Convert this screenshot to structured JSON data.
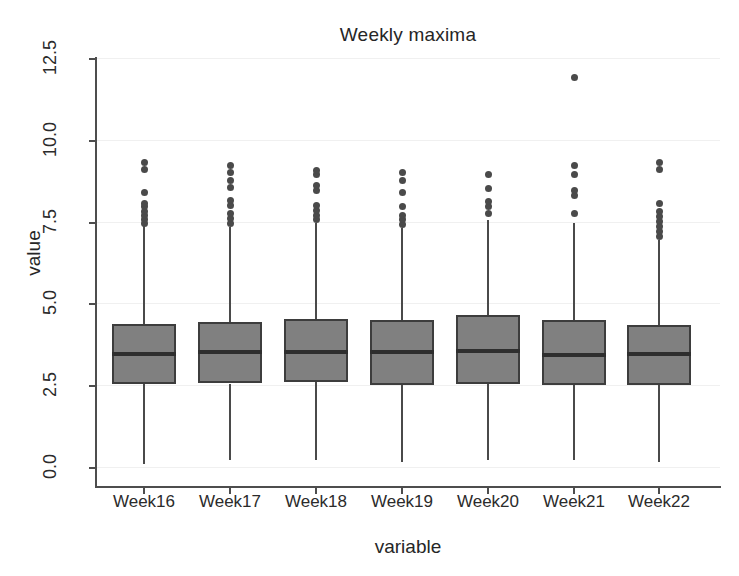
{
  "chart_data": {
    "type": "box",
    "title": "Weekly maxima",
    "xlabel": "variable",
    "ylabel": "value",
    "ylim": [
      0.0,
      12.5
    ],
    "yticks": [
      "0.0",
      "2.5",
      "5.0",
      "7.5",
      "10.0",
      "12.5"
    ],
    "ytick_values": [
      0.0,
      2.5,
      5.0,
      7.5,
      10.0,
      12.5
    ],
    "grid": true,
    "legend": "none",
    "categories": [
      "Week16",
      "Week17",
      "Week18",
      "Week19",
      "Week20",
      "Week21",
      "Week22"
    ],
    "box_fill_color": "#808080",
    "box_edge_color": "#3d3d3d",
    "median_color": "#2e2e2e",
    "outlier_color": "#4a4a4a",
    "boxes": [
      {
        "label": "Week16",
        "whisker_low": 0.12,
        "q1": 2.55,
        "median": 3.45,
        "q3": 4.37,
        "whisker_high": 7.4,
        "outliers": [
          7.45,
          7.55,
          7.7,
          7.8,
          7.95,
          8.05,
          8.4,
          9.1,
          9.3
        ]
      },
      {
        "label": "Week17",
        "whisker_low": 0.23,
        "q1": 2.55,
        "median": 3.52,
        "q3": 4.42,
        "whisker_high": 7.35,
        "outliers": [
          7.45,
          7.6,
          7.75,
          8.0,
          8.15,
          8.55,
          8.75,
          9.0,
          9.2
        ]
      },
      {
        "label": "Week18",
        "whisker_low": 0.22,
        "q1": 2.6,
        "median": 3.52,
        "q3": 4.52,
        "whisker_high": 7.45,
        "outliers": [
          7.55,
          7.7,
          7.85,
          8.0,
          8.45,
          8.6,
          8.95,
          9.05
        ]
      },
      {
        "label": "Week19",
        "whisker_low": 0.15,
        "q1": 2.5,
        "median": 3.5,
        "q3": 4.5,
        "whisker_high": 7.3,
        "outliers": [
          7.4,
          7.55,
          7.7,
          7.95,
          8.4,
          8.75,
          9.0
        ]
      },
      {
        "label": "Week20",
        "whisker_low": 0.22,
        "q1": 2.54,
        "median": 3.54,
        "q3": 4.64,
        "whisker_high": 7.55,
        "outliers": [
          7.75,
          7.95,
          8.1,
          8.5,
          8.95
        ]
      },
      {
        "label": "Week21",
        "whisker_low": 0.22,
        "q1": 2.5,
        "median": 3.42,
        "q3": 4.5,
        "whisker_high": 7.45,
        "outliers": [
          7.75,
          8.3,
          8.45,
          8.95,
          9.2,
          11.9
        ]
      },
      {
        "label": "Week22",
        "whisker_low": 0.16,
        "q1": 2.52,
        "median": 3.45,
        "q3": 4.35,
        "whisker_high": 6.95,
        "outliers": [
          7.05,
          7.2,
          7.35,
          7.5,
          7.65,
          7.8,
          8.05,
          9.1,
          9.3
        ]
      }
    ]
  }
}
